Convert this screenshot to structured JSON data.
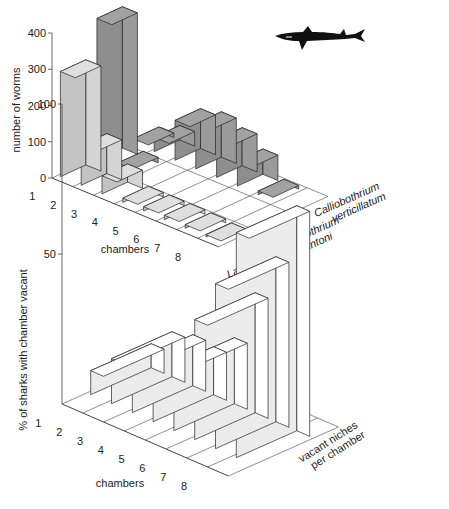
{
  "chart_data": [
    {
      "type": "bar",
      "subtype": "3d-bar",
      "title": "",
      "xlabel": "chambers",
      "ylabel": "number of worms",
      "zlabel": "species",
      "categories": [
        "1",
        "2",
        "3",
        "4",
        "5",
        "6",
        "7",
        "8"
      ],
      "yticks": [
        "0",
        "100",
        "200",
        "300",
        "400"
      ],
      "ylim": [
        0,
        400
      ],
      "series": [
        {
          "name": "Lacistorhynchus tenuis",
          "name_line1": "Lacistorhynchus",
          "name_line2": "tenuis",
          "color": "#d4d4d4",
          "values": [
            290,
            110,
            50,
            12,
            12,
            12,
            10,
            6
          ]
        },
        {
          "name": "Calliobothrium lintoni",
          "name_line1": "Calliobothrium",
          "name_line2": "lintoni",
          "color": "#9a9a9a",
          "values": [
            390,
            15,
            0,
            0,
            0,
            0,
            0,
            0
          ]
        },
        {
          "name": "Calliobothrium verticillatum",
          "name_line1": "Calliobothrium",
          "name_line2": "verticillatum",
          "color": "#9a9a9a",
          "values": [
            12,
            40,
            110,
            125,
            105,
            70,
            10,
            0
          ]
        }
      ],
      "grid": true,
      "annotation_icon": "shark-silhouette-icon"
    },
    {
      "type": "bar",
      "subtype": "3d-bar",
      "title": "",
      "xlabel": "chambers",
      "ylabel": "% of sharks with chamber vacant",
      "categories": [
        "1",
        "2",
        "3",
        "4",
        "5",
        "6",
        "7",
        "8"
      ],
      "yticks": [
        "50",
        "100"
      ],
      "ylim": [
        0,
        100
      ],
      "series": [
        {
          "name": "vacant niches per chamber",
          "name_line1": "vacant niches",
          "name_line2": "per chamber",
          "color": "#ffffff",
          "values": [
            8,
            15,
            17,
            16,
            22,
            40,
            55,
            75
          ]
        }
      ],
      "grid": true
    }
  ],
  "labels": {
    "top_ylabel": "number of worms",
    "top_xlabel": "chambers",
    "bottom_ylabel": "% of sharks with chamber vacant",
    "bottom_xlabel": "chambers",
    "top_yticks": [
      "0",
      "100",
      "200",
      "300",
      "400"
    ],
    "bottom_yticks": [
      "50",
      "100"
    ],
    "chambers": [
      "1",
      "2",
      "3",
      "4",
      "5",
      "6",
      "7",
      "8"
    ],
    "species": [
      {
        "l1": "Lacistorhynchus",
        "l2": "tenuis"
      },
      {
        "l1": "Calliobothrium",
        "l2": "lintoni"
      },
      {
        "l1": "Calliobothrium",
        "l2": "verticillatum"
      }
    ],
    "vacant_l1": "vacant niches",
    "vacant_l2": "per chamber"
  }
}
